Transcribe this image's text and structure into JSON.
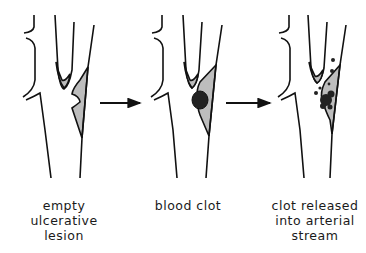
{
  "diagram": {
    "colors": {
      "stroke": "#111111",
      "plaque": "#bdbdbd",
      "clot": "#222222",
      "background": "#ffffff"
    },
    "stages": [
      {
        "id": "empty-lesion",
        "label_lines": [
          "empty",
          "ulcerative",
          "lesion"
        ]
      },
      {
        "id": "blood-clot",
        "label_lines": [
          "blood clot"
        ]
      },
      {
        "id": "clot-released",
        "label_lines": [
          "clot released",
          "into arterial",
          "stream"
        ]
      }
    ],
    "arrows": [
      {
        "from": "empty-lesion",
        "to": "blood-clot",
        "icon": "right-arrow"
      },
      {
        "from": "blood-clot",
        "to": "clot-released",
        "icon": "right-arrow"
      }
    ]
  }
}
